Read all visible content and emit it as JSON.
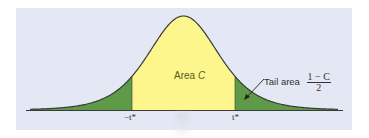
{
  "figure": {
    "type": "t-distribution-curve",
    "center_label_prefix": "Area ",
    "center_label_var": "C",
    "tail_label": "Tail area",
    "tail_fraction_numerator": "1 − C",
    "tail_fraction_denominator": "2",
    "left_critical_label": "−t*",
    "right_critical_label": "t*",
    "colors": {
      "background": "#e3e8f4",
      "center_fill": "#fdf68c",
      "tail_fill": "#5f9a48",
      "curve": "#3a3a3a"
    }
  }
}
